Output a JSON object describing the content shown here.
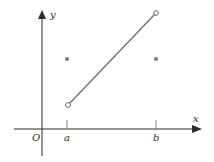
{
  "diagram": {
    "axes": {
      "x_label": "x",
      "y_label": "y",
      "origin_label": "O",
      "tick_labels": [
        "a",
        "b"
      ]
    },
    "segment": {
      "from": {
        "x": "a",
        "open": true
      },
      "to": {
        "x": "b",
        "open": true
      },
      "color": "#6e6e6e"
    },
    "points": [
      {
        "x": "a",
        "filled": true
      },
      {
        "x": "b",
        "filled": true
      }
    ],
    "colors": {
      "axis": "#2b2b2b",
      "point": "#7a7a7a"
    }
  }
}
